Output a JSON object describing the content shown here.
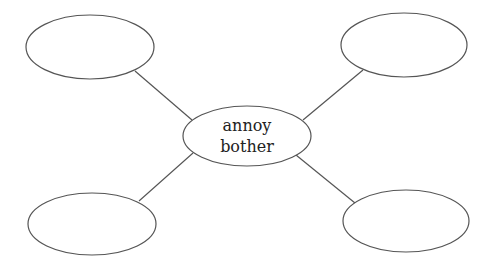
{
  "diagram": {
    "type": "word-web",
    "center": {
      "lines": [
        "annoy",
        "bother"
      ]
    },
    "outer_nodes": [
      {
        "position": "top-left",
        "text": ""
      },
      {
        "position": "top-right",
        "text": ""
      },
      {
        "position": "bottom-left",
        "text": ""
      },
      {
        "position": "bottom-right",
        "text": ""
      }
    ],
    "colors": {
      "stroke": "#555555",
      "text": "#222222",
      "background": "#ffffff"
    }
  }
}
